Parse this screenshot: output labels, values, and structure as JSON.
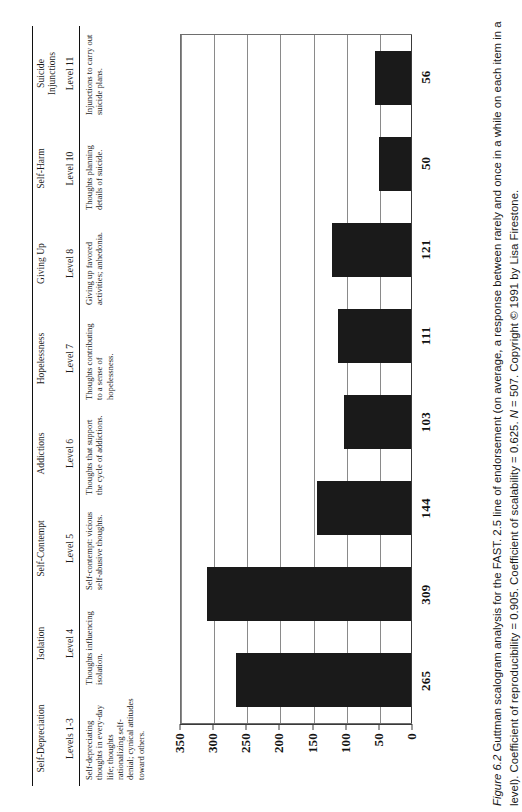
{
  "figure": {
    "caption_label": "Figure 6.2",
    "caption_text": " Guttman scalogram analysis for the FAST. 2.5 line of endorsement (on average, a response between rarely and once in a while on each item in a level). Coefficient of reproducibility = 0.905. Coefficient of scalability = 0.625. ",
    "caption_n_label": "N",
    "caption_n_value": " = 507. Copyright © 1991 by Lisa Firestone."
  },
  "table": {
    "categories": [
      {
        "name": "Self-Depreciation",
        "level": "Levels 1-3",
        "description": "Self-depreciating thoughts in every-day life; thoughts rationalizing self-denial; cynical attitudes toward others."
      },
      {
        "name": "Isolation",
        "level": "Level 4",
        "description": "Thoughts influencing isolation."
      },
      {
        "name": "Self-Contempt",
        "level": "Level 5",
        "description": "Self-contempt: vicious self-abusive thoughts."
      },
      {
        "name": "Addictions",
        "level": "Level 6",
        "description": "Thoughts that support the cycle of addictions."
      },
      {
        "name": "Hopelessness",
        "level": "Level 7",
        "description": "Thoughts contributing to a sense of hopelessness."
      },
      {
        "name": "Giving Up",
        "level": "Level 8",
        "description": "Giving up favored activities; anhedonia."
      },
      {
        "name": "Self-Harm",
        "level": "Level 10",
        "description": "Thoughts planning details of suicide."
      },
      {
        "name": "Suicide\nInjunctions",
        "level": "Level 11",
        "description": "Injunctions to carry out suicide plans."
      }
    ]
  },
  "chart_data": {
    "type": "bar",
    "title": "",
    "xlabel": "",
    "ylabel": "",
    "categories": [
      "Levels 1-3",
      "Level 4",
      "Level 5",
      "Level 6",
      "Level 7",
      "Level 8",
      "Level 10",
      "Level 11"
    ],
    "category_names": [
      "Self-Depreciation",
      "Isolation",
      "Self-Contempt",
      "Addictions",
      "Hopelessness",
      "Giving Up",
      "Self-Harm",
      "Suicide Injunctions"
    ],
    "values": [
      265,
      309,
      144,
      103,
      111,
      121,
      50,
      56
    ],
    "ylim": [
      0,
      350
    ],
    "yticks": [
      350,
      300,
      250,
      200,
      150,
      100,
      50,
      0
    ],
    "grid": true,
    "legend": "none",
    "bar_color": "#1a1a1a",
    "orientation": "vertical-rotated"
  }
}
